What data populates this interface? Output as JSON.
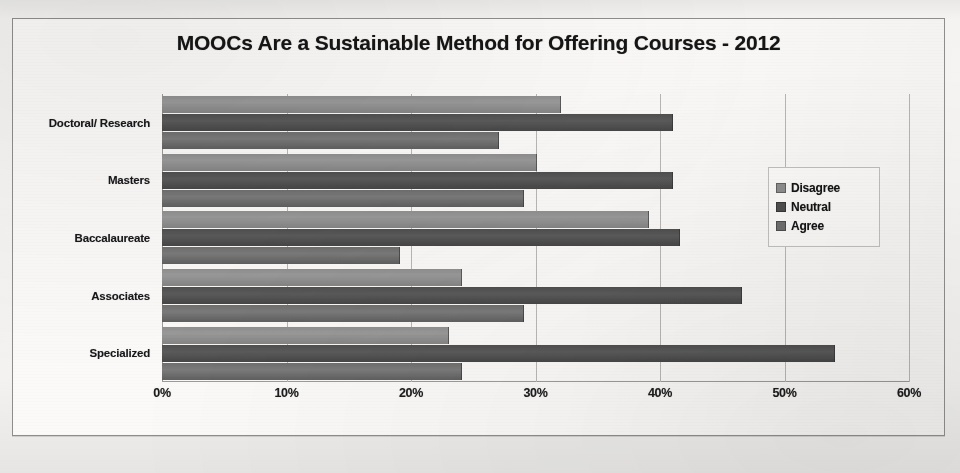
{
  "chart_data": {
    "type": "bar",
    "orientation": "horizontal",
    "title": "MOOCs Are a Sustainable Method for Offering Courses - 2012",
    "xlabel": "",
    "ylabel": "",
    "xlim": [
      0,
      60
    ],
    "xticks": [
      "0%",
      "10%",
      "20%",
      "30%",
      "40%",
      "50%",
      "60%"
    ],
    "xtick_values": [
      0,
      10,
      20,
      30,
      40,
      50,
      60
    ],
    "grid": true,
    "legend_position": "right",
    "categories": [
      "Doctoral/ Research",
      "Masters",
      "Baccalaureate",
      "Associates",
      "Specialized"
    ],
    "series": [
      {
        "name": "Disagree",
        "color": "#8f8f8f",
        "values": [
          32,
          30,
          39,
          24,
          23
        ]
      },
      {
        "name": "Neutral",
        "color": "#4f4f4f",
        "values": [
          41,
          41,
          41.5,
          46.5,
          54
        ]
      },
      {
        "name": "Agree",
        "color": "#6f6f6f",
        "values": [
          27,
          29,
          19,
          29,
          24
        ]
      }
    ]
  },
  "legend": {
    "items": [
      {
        "label": "Disagree"
      },
      {
        "label": "Neutral"
      },
      {
        "label": "Agree"
      }
    ]
  }
}
